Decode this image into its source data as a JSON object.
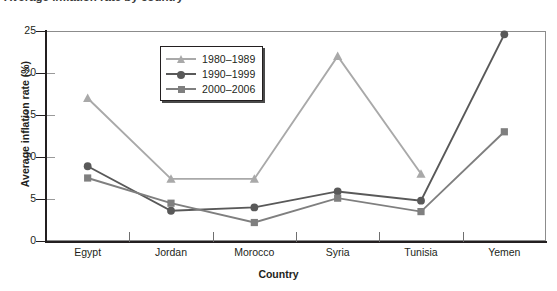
{
  "title": "Average inflation rate by country",
  "chart_data": {
    "type": "line",
    "title": "Average inflation rate by country",
    "xlabel": "Country",
    "ylabel": "Average inflation rate (%)",
    "categories": [
      "Egypt",
      "Jordan",
      "Morocco",
      "Syria",
      "Tunisia",
      "Yemen"
    ],
    "ylim": [
      0,
      25
    ],
    "yticks": [
      0,
      5,
      10,
      15,
      20,
      25
    ],
    "grid": false,
    "legend_position": "upper-center-left",
    "series": [
      {
        "name": "1980–1989",
        "marker": "triangle",
        "color": "#a9a9a9",
        "values": [
          17.0,
          7.4,
          7.4,
          22.0,
          8.0,
          null
        ]
      },
      {
        "name": "1990–1999",
        "marker": "circle",
        "color": "#595959",
        "values": [
          8.9,
          3.6,
          4.0,
          5.9,
          4.8,
          24.6
        ]
      },
      {
        "name": "2000–2006",
        "marker": "square",
        "color": "#7f7f7f",
        "values": [
          7.5,
          4.5,
          2.2,
          5.1,
          3.5,
          13.0
        ]
      }
    ]
  }
}
